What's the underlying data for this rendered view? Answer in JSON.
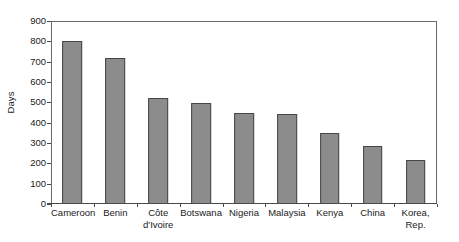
{
  "chart_data": {
    "type": "bar",
    "title": "",
    "subtitle": "",
    "xlabel": "",
    "ylabel": "Days",
    "ylim": [
      0,
      900
    ],
    "y_ticks": [
      0,
      100,
      200,
      300,
      400,
      500,
      600,
      700,
      800,
      900
    ],
    "y_tick_labels": [
      "0",
      "100",
      "200",
      "300",
      "400",
      "500",
      "600",
      "700",
      "800",
      "900"
    ],
    "grid": false,
    "legend": false,
    "legend_position": "none",
    "categories": [
      "Cameroon",
      "Benin",
      "Côte d'Ivoire",
      "Botswana",
      "Nigeria",
      "Malaysia",
      "Kenya",
      "China",
      "Korea, Rep."
    ],
    "category_lines": [
      [
        "Cameroon"
      ],
      [
        "Benin"
      ],
      [
        "Côte",
        "d'Ivoire"
      ],
      [
        "Botswana"
      ],
      [
        "Nigeria"
      ],
      [
        "Malaysia"
      ],
      [
        "Kenya"
      ],
      [
        "China"
      ],
      [
        "Korea, Rep."
      ]
    ],
    "values": [
      800,
      720,
      520,
      497,
      450,
      441,
      350,
      283,
      217
    ],
    "bar_fill_color": "#8c8c8c",
    "bar_edge_color": "#464646",
    "axis_color": "#4a4a4a",
    "frame_color": "#6b6b6b",
    "background_color": "#ffffff"
  }
}
